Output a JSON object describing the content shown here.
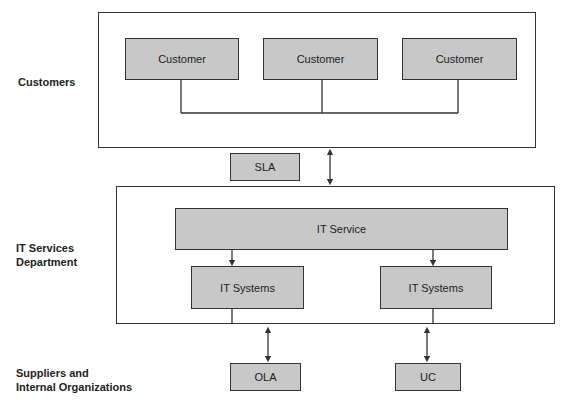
{
  "diagram": {
    "title": "",
    "row_labels": {
      "customers": "Customers",
      "it_services_line1": "IT Services",
      "it_services_line2": "Department",
      "suppliers_line1": "Suppliers and",
      "suppliers_line2": "Internal Organizations"
    },
    "customers": [
      {
        "label": "Customer"
      },
      {
        "label": "Customer"
      },
      {
        "label": "Customer"
      }
    ],
    "sla": {
      "label": "SLA"
    },
    "it_service": {
      "label": "IT Service"
    },
    "it_systems": [
      {
        "label": "IT Systems"
      },
      {
        "label": "IT Systems"
      }
    ],
    "ola": {
      "label": "OLA"
    },
    "uc": {
      "label": "UC"
    },
    "colors": {
      "box_fill": "#c8c8c8",
      "line": "#333333",
      "background": "#ffffff"
    }
  }
}
